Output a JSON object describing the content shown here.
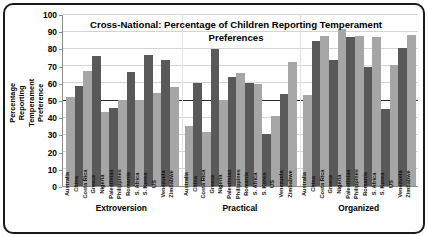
{
  "chart_data": {
    "type": "bar",
    "title": "Cross-National: Percentage of Children Reporting Temperament Preferences",
    "title_line1": "Cross-National: Percentage of Children Reporting Temperament",
    "title_line2": "Preferences",
    "xlabel": "",
    "ylabel": "Percentage Reporting Temperament Preference",
    "ylim": [
      0,
      100
    ],
    "ytick_labels": [
      "0",
      "10",
      "20",
      "30",
      "40",
      "50",
      "60",
      "70",
      "80",
      "90",
      "100"
    ],
    "ytick_values": [
      0,
      10,
      20,
      30,
      40,
      50,
      60,
      70,
      80,
      90,
      100
    ],
    "grid": true,
    "reference_line": 50,
    "legend": "none",
    "groups": [
      "Extroversion",
      "Practical",
      "Organized"
    ],
    "categories": [
      "Australia",
      "China",
      "Costa Rica",
      "Greece",
      "Nigeria",
      "Palestinian",
      "Philippines",
      "Romania",
      "S. Africa",
      "S. Korea",
      "US",
      "Venezuela",
      "Zimbabwe"
    ],
    "series": [
      {
        "name": "Extroversion",
        "values": [
          52,
          58.5,
          67.5,
          76,
          43.5,
          45.5,
          50.5,
          66.5,
          50.5,
          76.5,
          54.5,
          73.5,
          58
        ]
      },
      {
        "name": "Practical",
        "values": [
          35,
          60.5,
          31.5,
          80,
          50.5,
          63.5,
          66,
          60,
          59.5,
          30.5,
          41,
          54,
          72.5
        ]
      },
      {
        "name": "Organized",
        "values": [
          53.5,
          85,
          88,
          73.5,
          92,
          87,
          88,
          69.5,
          87,
          45,
          70.5,
          81,
          88.5
        ]
      }
    ],
    "colors": {
      "bar_light": "#a6a6a6",
      "bar_dark": "#595959",
      "gridline": "#d4d4d4",
      "reference_line": "#2b2b2b",
      "axis": "#8c8c8c",
      "frame_border": "#1a1a1a",
      "text": "#000000"
    }
  }
}
